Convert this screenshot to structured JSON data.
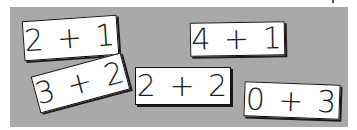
{
  "scene": {
    "background_color": "#ffffff",
    "panel_color": "#a9a9a9",
    "card_color": "#ffffff",
    "card_border_color": "#111111",
    "ink_color": "#1a1a1a"
  },
  "cards": [
    {
      "label": "2 + 1",
      "x": 23,
      "y": 18,
      "width": 95,
      "height": 40,
      "rotation_deg": -4
    },
    {
      "label": "3 + 2",
      "x": 34,
      "y": 64,
      "width": 93,
      "height": 38,
      "rotation_deg": -15
    },
    {
      "label": "2 + 2",
      "x": 135,
      "y": 67,
      "width": 96,
      "height": 38,
      "rotation_deg": 0
    },
    {
      "label": "4 + 1",
      "x": 190,
      "y": 22,
      "width": 95,
      "height": 34,
      "rotation_deg": -1
    },
    {
      "label": "0 + 3",
      "x": 244,
      "y": 83,
      "width": 96,
      "height": 35,
      "rotation_deg": 2
    }
  ]
}
